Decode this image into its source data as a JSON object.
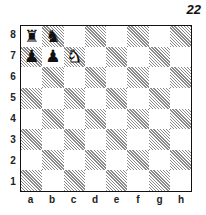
{
  "diagram": {
    "number": "22",
    "files": [
      "a",
      "b",
      "c",
      "d",
      "e",
      "f",
      "g",
      "h"
    ],
    "ranks": [
      "8",
      "7",
      "6",
      "5",
      "4",
      "3",
      "2",
      "1"
    ],
    "colors": {
      "dark_square_hatch": "#8a8a8a",
      "light_square": "#ffffff",
      "border": "#111111"
    },
    "pieces": [
      {
        "square": "a8",
        "color": "black",
        "type": "rook",
        "glyph": "♜"
      },
      {
        "square": "b8",
        "color": "black",
        "type": "knight",
        "glyph": "♞"
      },
      {
        "square": "a7",
        "color": "black",
        "type": "pawn",
        "glyph": "♟"
      },
      {
        "square": "b7",
        "color": "black",
        "type": "pawn",
        "glyph": "♟"
      },
      {
        "square": "c7",
        "color": "white",
        "type": "knight",
        "glyph": "♞"
      }
    ]
  }
}
